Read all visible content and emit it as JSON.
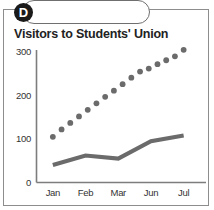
{
  "badge": {
    "letter": "D",
    "background_color": "#1a1a1a",
    "text_color": "#ffffff"
  },
  "chart_data": {
    "type": "line",
    "title": "Visitors to Students' Union",
    "xlabel": "",
    "ylabel": "",
    "categories": [
      "Jan",
      "Feb",
      "Mar",
      "Jun",
      "Jul"
    ],
    "ylim": [
      0,
      300
    ],
    "yticks": [
      0,
      100,
      200,
      300
    ],
    "ytick_labels": [
      "0",
      "100",
      "200",
      "300"
    ],
    "grid": false,
    "legend": "none",
    "series": [
      {
        "name": "dotted-series",
        "style": "dotted",
        "marker": "circle",
        "color": "#6b6b6b",
        "x": [
          "Jan",
          "",
          "",
          "",
          "Feb",
          "",
          "",
          "",
          "Mar",
          "",
          "",
          "",
          "Jun",
          "",
          "",
          "Jul"
        ],
        "values": [
          105,
          122,
          137,
          152,
          167,
          182,
          197,
          211,
          226,
          241,
          255,
          262,
          272,
          281,
          290,
          305
        ]
      },
      {
        "name": "solid-series",
        "style": "solid",
        "marker": "none",
        "color": "#6b6b6b",
        "x": [
          "Jan",
          "Feb",
          "Mar",
          "Jun",
          "Jul"
        ],
        "values": [
          40,
          62,
          55,
          95,
          108
        ]
      }
    ]
  },
  "axes": {
    "axis_color": "#7d7d7d",
    "frame_color": "#8d8d8d",
    "background": "#ffffff"
  }
}
